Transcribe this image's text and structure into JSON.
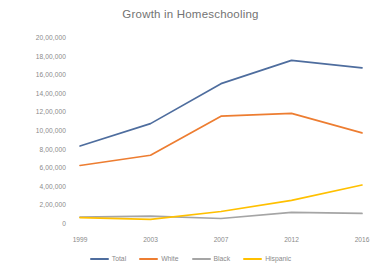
{
  "chart_data": {
    "type": "line",
    "title": "Growth in Homeschooling",
    "xlabel": "",
    "ylabel": "",
    "categories": [
      "1999",
      "2003",
      "2007",
      "2012",
      "2016"
    ],
    "x": [
      1999,
      2003,
      2007,
      2012,
      2016
    ],
    "ylim": [
      0,
      2000000
    ],
    "ytick_values": [
      0,
      200000,
      400000,
      600000,
      800000,
      1000000,
      1200000,
      1400000,
      1600000,
      1800000,
      2000000
    ],
    "ytick_labels": [
      "0",
      "2,00,000",
      "4,00,000",
      "6,00,000",
      "8,00,000",
      "10,00,000",
      "12,00,000",
      "14,00,000",
      "16,00,000",
      "18,00,000",
      "20,00,000"
    ],
    "grid": false,
    "legend_position": "bottom",
    "series": [
      {
        "name": "Total",
        "color": "#4E6D9E",
        "values": [
          850000,
          1090000,
          1520000,
          1770000,
          1690000
        ]
      },
      {
        "name": "White",
        "color": "#ED7D31",
        "values": [
          640000,
          750000,
          1170000,
          1200000,
          990000
        ]
      },
      {
        "name": "Black",
        "color": "#A5A5A5",
        "values": [
          85000,
          95000,
          70000,
          135000,
          125000
        ]
      },
      {
        "name": "Hispanic",
        "color": "#FFC000",
        "values": [
          80000,
          60000,
          145000,
          265000,
          430000
        ]
      }
    ]
  },
  "legend": {
    "items": [
      {
        "label": "Total"
      },
      {
        "label": "White"
      },
      {
        "label": "Black"
      },
      {
        "label": "Hispanic"
      }
    ]
  }
}
